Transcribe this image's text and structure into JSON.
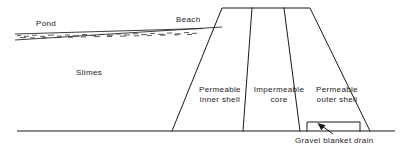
{
  "figure": {
    "kind": "tailings-dam-cross-section",
    "line_color": "#1a1a1a",
    "background": "#ffffff"
  },
  "labels": {
    "pond": "Pond",
    "beach": "Beach",
    "slimes": "Slimes",
    "gravel_blanket_drain": "Gravel blanket drain"
  },
  "zones": [
    {
      "id": "permeable-inner-shell",
      "line1": "Permeable",
      "line2": "inner shell"
    },
    {
      "id": "impermeable-core",
      "line1": "Impermeable",
      "line2": "core"
    },
    {
      "id": "permeable-outer-shell",
      "line1": "Permeable",
      "line2": "outer shell"
    }
  ],
  "geometry": {
    "ground_line": {
      "x1": 17,
      "y1": 131,
      "x2": 395,
      "y2": 131
    },
    "crest": {
      "x1": 222,
      "y": 8,
      "x2": 310
    },
    "upstream_toe_x": 172,
    "downstream_toe_x": 370,
    "divider_top_x": [
      252,
      284
    ],
    "divider_base_x": [
      243,
      300
    ],
    "pond_wedge": {
      "tip_x": 15,
      "tip_y": 35,
      "end_x": 200,
      "end_y_top": 27,
      "end_y_bot": 31
    },
    "beach_slope": {
      "x1": 15,
      "y1": 39,
      "x2": 222,
      "y2": 27
    },
    "drain_rect": {
      "x": 307,
      "y": 122,
      "width": 53,
      "height": 9
    },
    "drain_arrow": {
      "from_x": 330,
      "from_y": 133,
      "to_x": 318,
      "to_y": 124
    }
  }
}
